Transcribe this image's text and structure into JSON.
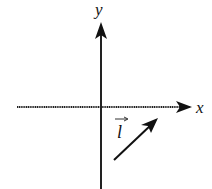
{
  "diagram": {
    "type": "coordinate-axes-with-vector",
    "axes": {
      "x": {
        "label": "x"
      },
      "y": {
        "label": "y"
      }
    },
    "vector": {
      "label": "l",
      "has_arrow_over_label": true,
      "direction": "up-right"
    },
    "colors": {
      "stroke": "#111111",
      "background": "#ffffff"
    }
  }
}
